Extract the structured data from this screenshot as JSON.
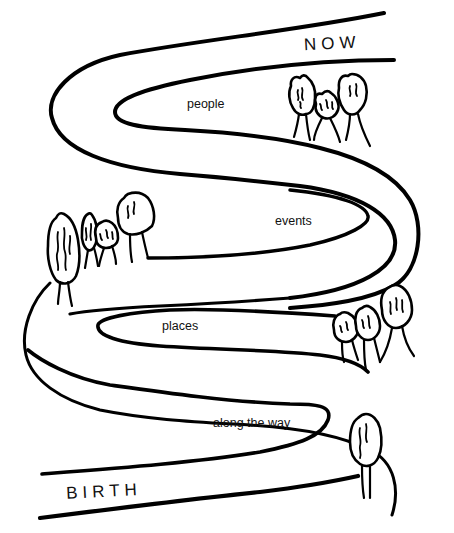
{
  "diagram": {
    "type": "life-path-illustration",
    "colors": {
      "ink": "#000000",
      "paper": "#ffffff"
    },
    "endpoints": {
      "start": "BIRTH",
      "end": "NOW"
    },
    "loop_labels": [
      "people",
      "events",
      "places",
      "along the way"
    ],
    "tree_groups": [
      {
        "location": "upper-right",
        "count": 3
      },
      {
        "location": "middle-left",
        "count": 4
      },
      {
        "location": "lower-right",
        "count": 3
      },
      {
        "location": "bottom-right",
        "count": 1
      }
    ]
  }
}
